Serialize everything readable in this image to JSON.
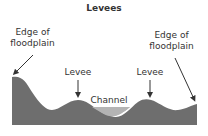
{
  "title": "Levees",
  "labels": {
    "edge_left_line1": "Edge of",
    "edge_left_line2": "floodplain",
    "edge_right_line1": "Edge of",
    "edge_right_line2": "floodplain",
    "levee_left": "Levee",
    "levee_right": "Levee",
    "channel": "Channel"
  },
  "colors": {
    "ground": "#6e6e6e",
    "water": "#b4b4b4",
    "text": "#333333",
    "arrow": "#333333"
  }
}
